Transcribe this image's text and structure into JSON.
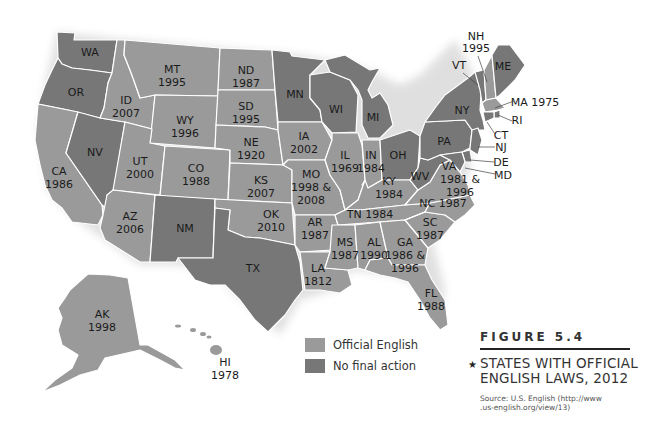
{
  "figure": {
    "number": "FIGURE 5.4",
    "star_icon": "★",
    "title_line1": "STATES WITH OFFICIAL",
    "title_line2": "ENGLISH LAWS, 2012",
    "source_line1": "Source: U.S. English (http://www",
    "source_line2": ".us-english.org/view/13)"
  },
  "legend": {
    "items": [
      {
        "label": "Official English",
        "color": "#9a9a9a"
      },
      {
        "label": "No final action",
        "color": "#777777"
      }
    ]
  },
  "colors": {
    "official_english": "#9a9a9a",
    "no_final_action": "#777777",
    "border": "#ffffff",
    "background": "#ffffff"
  },
  "states": {
    "WA": {
      "abbr": "WA",
      "year": "",
      "status": "No final action"
    },
    "OR": {
      "abbr": "OR",
      "year": "",
      "status": "No final action"
    },
    "CA": {
      "abbr": "CA",
      "year": "1986",
      "status": "Official English"
    },
    "NV": {
      "abbr": "NV",
      "year": "",
      "status": "No final action"
    },
    "ID": {
      "abbr": "ID",
      "year": "2007",
      "status": "Official English"
    },
    "MT": {
      "abbr": "MT",
      "year": "1995",
      "status": "Official English"
    },
    "WY": {
      "abbr": "WY",
      "year": "1996",
      "status": "Official English"
    },
    "UT": {
      "abbr": "UT",
      "year": "2000",
      "status": "Official English"
    },
    "CO": {
      "abbr": "CO",
      "year": "1988",
      "status": "Official English"
    },
    "AZ": {
      "abbr": "AZ",
      "year": "2006",
      "status": "Official English"
    },
    "NM": {
      "abbr": "NM",
      "year": "",
      "status": "No final action"
    },
    "ND": {
      "abbr": "ND",
      "year": "1987",
      "status": "Official English"
    },
    "SD": {
      "abbr": "SD",
      "year": "1995",
      "status": "Official English"
    },
    "NE": {
      "abbr": "NE",
      "year": "1920",
      "status": "Official English"
    },
    "KS": {
      "abbr": "KS",
      "year": "2007",
      "status": "Official English"
    },
    "OK": {
      "abbr": "OK",
      "year": "2010",
      "status": "Official English"
    },
    "TX": {
      "abbr": "TX",
      "year": "",
      "status": "No final action"
    },
    "MN": {
      "abbr": "MN",
      "year": "",
      "status": "No final action"
    },
    "IA": {
      "abbr": "IA",
      "year": "2002",
      "status": "Official English"
    },
    "MO": {
      "abbr": "MO",
      "year": "1998 &",
      "year2": "2008",
      "status": "Official English"
    },
    "AR": {
      "abbr": "AR",
      "year": "1987",
      "status": "Official English"
    },
    "LA": {
      "abbr": "LA",
      "year": "1812",
      "status": "Official English"
    },
    "WI": {
      "abbr": "WI",
      "year": "",
      "status": "No final action"
    },
    "IL": {
      "abbr": "IL",
      "year": "1969",
      "status": "Official English"
    },
    "MI": {
      "abbr": "MI",
      "year": "",
      "status": "No final action"
    },
    "IN": {
      "abbr": "IN",
      "year": "1984",
      "status": "Official English"
    },
    "OH": {
      "abbr": "OH",
      "year": "",
      "status": "No final action"
    },
    "KY": {
      "abbr": "KY",
      "year": "1984",
      "status": "Official English"
    },
    "TN": {
      "abbr": "TN",
      "year": "1984",
      "label": "TN 1984",
      "status": "Official English"
    },
    "MS": {
      "abbr": "MS",
      "year": "1987",
      "status": "Official English"
    },
    "AL": {
      "abbr": "AL",
      "year": "1990",
      "status": "Official English"
    },
    "GA": {
      "abbr": "GA",
      "year": "1986 &",
      "year2": "1996",
      "status": "Official English"
    },
    "FL": {
      "abbr": "FL",
      "year": "1988",
      "status": "Official English"
    },
    "SC": {
      "abbr": "SC",
      "year": "1987",
      "status": "Official English"
    },
    "NC": {
      "abbr": "NC",
      "year": "1987",
      "label": "NC 1987",
      "status": "Official English"
    },
    "VA": {
      "abbr": "VA",
      "year": "1981 &",
      "year2": "1996",
      "status": "Official English"
    },
    "WV": {
      "abbr": "WV",
      "year": "",
      "status": "No final action"
    },
    "PA": {
      "abbr": "PA",
      "year": "",
      "status": "No final action"
    },
    "NY": {
      "abbr": "NY",
      "year": "",
      "status": "No final action"
    },
    "VT": {
      "abbr": "VT",
      "year": "",
      "status": "No final action"
    },
    "NH": {
      "abbr": "NH",
      "year": "1995",
      "status": "Official English"
    },
    "ME": {
      "abbr": "ME",
      "year": "",
      "status": "No final action"
    },
    "MA": {
      "abbr": "MA",
      "year": "1975",
      "label": "MA 1975",
      "status": "Official English"
    },
    "RI": {
      "abbr": "RI",
      "year": "",
      "status": "No final action"
    },
    "CT": {
      "abbr": "CT",
      "year": "",
      "status": "No final action"
    },
    "NJ": {
      "abbr": "NJ",
      "year": "",
      "status": "No final action"
    },
    "DE": {
      "abbr": "DE",
      "year": "",
      "status": "No final action"
    },
    "MD": {
      "abbr": "MD",
      "year": "",
      "status": "No final action"
    },
    "AK": {
      "abbr": "AK",
      "year": "1998",
      "status": "Official English"
    },
    "HI": {
      "abbr": "HI",
      "year": "1978",
      "status": "Official English"
    }
  }
}
